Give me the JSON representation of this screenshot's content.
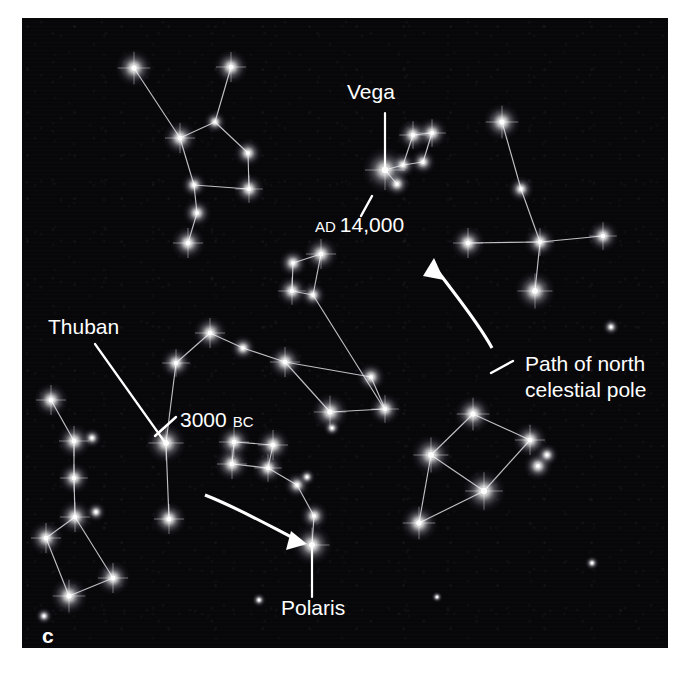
{
  "figure": {
    "panel_letter": "c",
    "background_color": "#07070a",
    "star_color": "#ffffff",
    "line_color": "#e8e8ee",
    "label_color": "#ffffff",
    "panel": {
      "x": 22,
      "y": 18,
      "width": 646,
      "height": 630
    }
  },
  "labels": [
    {
      "name": "vega-label",
      "text": "Vega",
      "x": 347,
      "y": 99,
      "anchor": "start"
    },
    {
      "name": "ad-14000-label",
      "text": "AD 14,000",
      "text_main": "14,000",
      "text_small": "AD",
      "x": 315,
      "y": 232,
      "anchor": "start"
    },
    {
      "name": "thuban-label",
      "text": "Thuban",
      "x": 48,
      "y": 334,
      "anchor": "start"
    },
    {
      "name": "bc-3000-label",
      "text": "3000 BC",
      "text_main": "3000",
      "text_small": "BC",
      "x": 180,
      "y": 427,
      "anchor": "start"
    },
    {
      "name": "polaris-label",
      "text": "Polaris",
      "x": 281,
      "y": 615,
      "anchor": "start"
    },
    {
      "name": "path-label-line1",
      "text": "Path of north",
      "x": 525,
      "y": 371,
      "anchor": "start"
    },
    {
      "name": "path-label-line2",
      "text": "celestial pole",
      "x": 525,
      "y": 397,
      "anchor": "start"
    }
  ],
  "leaders": [
    {
      "name": "vega-leader",
      "points": "385,113 385,167"
    },
    {
      "name": "ad-14000-tick",
      "points": "372,196 361,216"
    },
    {
      "name": "thuban-leader",
      "points": "95,344 164,441"
    },
    {
      "name": "bc-3000-tick",
      "points": "176,417 155,436"
    },
    {
      "name": "polaris-leader",
      "points": "312,548 312,597"
    },
    {
      "name": "path-label-tick",
      "points": "513,361 491,373"
    }
  ],
  "pole_path_arrows": [
    {
      "name": "pole-path-arrow-upper",
      "description": "curved arrow from label area up toward Cygnus",
      "curve": "M 492,348 C 478,322 456,296 434,266",
      "head": "434,258 444,280 423,276"
    },
    {
      "name": "pole-path-arrow-lower",
      "description": "curved arrow from lower left toward Polaris",
      "curve": "M 205,495 C 238,508 268,525 295,539",
      "head": "307,544 286,550 291,531"
    }
  ],
  "chart_data": {
    "type": "scatter",
    "annotations": [
      "Vega",
      "AD 14,000",
      "Thuban",
      "3000 BC",
      "Polaris",
      "Path of north celestial pole"
    ],
    "named_stars": [
      {
        "name": "Vega",
        "x": 385,
        "y": 170,
        "magnitude": "bright",
        "epoch": "AD 14,000"
      },
      {
        "name": "Thuban",
        "x": 166,
        "y": 443,
        "magnitude": "bright",
        "epoch": "3000 BC"
      },
      {
        "name": "Polaris",
        "x": 312,
        "y": 545,
        "magnitude": "bright",
        "epoch": "present"
      }
    ],
    "constellations": [
      {
        "name": "cepheus",
        "stars": [
          {
            "x": 134,
            "y": 68,
            "r": 6.5
          },
          {
            "x": 180,
            "y": 138,
            "r": 6.0
          },
          {
            "x": 215,
            "y": 122,
            "r": 4.0
          },
          {
            "x": 231,
            "y": 67,
            "r": 6.0
          },
          {
            "x": 248,
            "y": 153,
            "r": 5.0
          },
          {
            "x": 249,
            "y": 189,
            "r": 5.5
          },
          {
            "x": 194,
            "y": 185,
            "r": 4.5
          },
          {
            "x": 197,
            "y": 213,
            "r": 5.0
          },
          {
            "x": 188,
            "y": 243,
            "r": 6.0
          }
        ],
        "edges": [
          [
            0,
            1
          ],
          [
            1,
            2
          ],
          [
            2,
            3
          ],
          [
            2,
            4
          ],
          [
            4,
            5
          ],
          [
            1,
            6
          ],
          [
            6,
            7
          ],
          [
            7,
            8
          ],
          [
            5,
            6
          ]
        ]
      },
      {
        "name": "cygnus",
        "stars": [
          {
            "x": 502,
            "y": 122,
            "r": 6.5
          },
          {
            "x": 521,
            "y": 189,
            "r": 4.5
          },
          {
            "x": 540,
            "y": 242,
            "r": 5.5
          },
          {
            "x": 468,
            "y": 243,
            "r": 6.0
          },
          {
            "x": 603,
            "y": 236,
            "r": 5.5
          },
          {
            "x": 535,
            "y": 291,
            "r": 7.0
          }
        ],
        "edges": [
          [
            0,
            1
          ],
          [
            1,
            2
          ],
          [
            2,
            3
          ],
          [
            2,
            4
          ],
          [
            2,
            5
          ]
        ]
      },
      {
        "name": "lyra-upper",
        "stars": [
          {
            "x": 385,
            "y": 170,
            "r": 8.0
          },
          {
            "x": 397,
            "y": 184,
            "r": 4.5
          },
          {
            "x": 403,
            "y": 165,
            "r": 4.5
          },
          {
            "x": 413,
            "y": 135,
            "r": 5.5
          },
          {
            "x": 432,
            "y": 133,
            "r": 5.5
          },
          {
            "x": 423,
            "y": 162,
            "r": 4.5
          }
        ],
        "edges": [
          [
            0,
            1
          ],
          [
            0,
            2
          ],
          [
            2,
            3
          ],
          [
            3,
            4
          ],
          [
            4,
            5
          ],
          [
            2,
            5
          ]
        ]
      },
      {
        "name": "lyra-middle",
        "stars": [
          {
            "x": 321,
            "y": 254,
            "r": 6.0
          },
          {
            "x": 293,
            "y": 263,
            "r": 5.0
          },
          {
            "x": 292,
            "y": 291,
            "r": 5.5
          },
          {
            "x": 313,
            "y": 295,
            "r": 4.5
          },
          {
            "x": 385,
            "y": 410,
            "r": 0.0
          }
        ],
        "edges": [
          [
            0,
            1
          ],
          [
            1,
            2
          ],
          [
            2,
            3
          ],
          [
            0,
            3
          ],
          [
            3,
            4
          ]
        ]
      },
      {
        "name": "draco",
        "stars": [
          {
            "x": 166,
            "y": 443,
            "r": 7.0
          },
          {
            "x": 176,
            "y": 363,
            "r": 5.5
          },
          {
            "x": 210,
            "y": 333,
            "r": 6.0
          },
          {
            "x": 243,
            "y": 348,
            "r": 4.5
          },
          {
            "x": 285,
            "y": 362,
            "r": 6.0
          },
          {
            "x": 330,
            "y": 412,
            "r": 6.5
          },
          {
            "x": 385,
            "y": 409,
            "r": 5.5
          },
          {
            "x": 371,
            "y": 377,
            "r": 5.0
          },
          {
            "x": 332,
            "y": 428,
            "r": 3.0
          },
          {
            "x": 169,
            "y": 519,
            "r": 6.0
          }
        ],
        "edges": [
          [
            0,
            1
          ],
          [
            1,
            2
          ],
          [
            2,
            3
          ],
          [
            3,
            4
          ],
          [
            4,
            5
          ],
          [
            5,
            6
          ],
          [
            6,
            7
          ],
          [
            7,
            4
          ],
          [
            0,
            9
          ]
        ]
      },
      {
        "name": "ursa-minor",
        "stars": [
          {
            "x": 234,
            "y": 442,
            "r": 6.0
          },
          {
            "x": 273,
            "y": 445,
            "r": 6.0
          },
          {
            "x": 232,
            "y": 464,
            "r": 6.0
          },
          {
            "x": 268,
            "y": 468,
            "r": 5.5
          },
          {
            "x": 297,
            "y": 485,
            "r": 4.5
          },
          {
            "x": 314,
            "y": 516,
            "r": 5.0
          },
          {
            "x": 312,
            "y": 545,
            "r": 7.0
          }
        ],
        "edges": [
          [
            0,
            1
          ],
          [
            0,
            2
          ],
          [
            2,
            3
          ],
          [
            1,
            3
          ],
          [
            3,
            4
          ],
          [
            4,
            5
          ],
          [
            5,
            6
          ]
        ]
      },
      {
        "name": "ursa-major",
        "stars": [
          {
            "x": 51,
            "y": 400,
            "r": 6.0
          },
          {
            "x": 74,
            "y": 441,
            "r": 6.0
          },
          {
            "x": 92,
            "y": 438,
            "r": 3.5
          },
          {
            "x": 74,
            "y": 478,
            "r": 5.5
          },
          {
            "x": 75,
            "y": 517,
            "r": 6.0
          },
          {
            "x": 46,
            "y": 538,
            "r": 6.0
          },
          {
            "x": 69,
            "y": 596,
            "r": 6.5
          },
          {
            "x": 113,
            "y": 578,
            "r": 6.0
          }
        ],
        "edges": [
          [
            0,
            1
          ],
          [
            1,
            3
          ],
          [
            3,
            4
          ],
          [
            4,
            5
          ],
          [
            5,
            6
          ],
          [
            6,
            7
          ],
          [
            7,
            4
          ]
        ]
      },
      {
        "name": "lyra-lower-right",
        "stars": [
          {
            "x": 473,
            "y": 414,
            "r": 6.5
          },
          {
            "x": 431,
            "y": 455,
            "r": 7.0
          },
          {
            "x": 530,
            "y": 440,
            "r": 6.0
          },
          {
            "x": 484,
            "y": 491,
            "r": 7.5
          },
          {
            "x": 547,
            "y": 455,
            "r": 4.0
          },
          {
            "x": 538,
            "y": 466,
            "r": 5.0
          },
          {
            "x": 419,
            "y": 523,
            "r": 6.5
          }
        ],
        "edges": [
          [
            0,
            1
          ],
          [
            0,
            2
          ],
          [
            2,
            3
          ],
          [
            1,
            3
          ],
          [
            3,
            6
          ],
          [
            1,
            6
          ]
        ]
      },
      {
        "name": "field-stars",
        "stars": [
          {
            "x": 307,
            "y": 477,
            "r": 3.0
          },
          {
            "x": 611,
            "y": 327,
            "r": 3.0
          },
          {
            "x": 96,
            "y": 512,
            "r": 3.5
          },
          {
            "x": 592,
            "y": 563,
            "r": 2.5
          },
          {
            "x": 259,
            "y": 600,
            "r": 2.5
          },
          {
            "x": 437,
            "y": 597,
            "r": 2.0
          },
          {
            "x": 44,
            "y": 616,
            "r": 3.0
          }
        ],
        "edges": []
      }
    ]
  }
}
